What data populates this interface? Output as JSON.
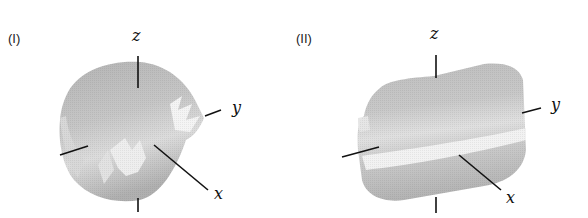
{
  "figure": {
    "panels": [
      {
        "label": "(I)",
        "axes": {
          "x": "x",
          "y": "y",
          "z": "z"
        },
        "description": "Cylindrical 3D surface along x-axis with ragged/broken end near y-axis"
      },
      {
        "label": "(II)",
        "axes": {
          "x": "x",
          "y": "y",
          "z": "z"
        },
        "description": "Smooth cylindrical 3D surface along y-axis with bright band"
      }
    ],
    "colors": {
      "surface_dark": "#a8a8a8",
      "surface_mid": "#c4c4c4",
      "surface_light": "#e8e8e8",
      "axis": "#111111"
    }
  }
}
